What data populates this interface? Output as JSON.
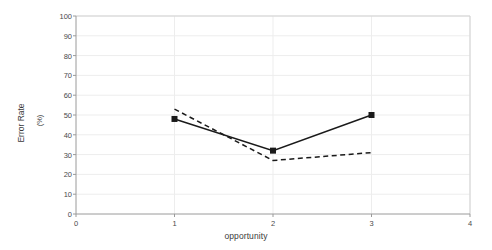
{
  "chart_data": {
    "type": "line",
    "title": "",
    "xlabel": "opportunity",
    "ylabel": "Error Rate",
    "yunit": "(%)",
    "x": [
      1,
      2,
      3
    ],
    "xlim": [
      0,
      4
    ],
    "ylim": [
      0,
      100
    ],
    "xticks": [
      "0",
      "1",
      "2",
      "3",
      "4"
    ],
    "yticks": [
      "0",
      "10",
      "20",
      "30",
      "40",
      "50",
      "60",
      "70",
      "80",
      "90",
      "100"
    ],
    "grid": true,
    "legend": "none",
    "series": [
      {
        "name": "series-solid",
        "style": "solid",
        "marker": "square",
        "color": "#1a1a1a",
        "values": [
          48,
          32,
          50
        ]
      },
      {
        "name": "series-dashed",
        "style": "dashed",
        "marker": "none",
        "color": "#1a1a1a",
        "values": [
          53,
          27,
          31
        ]
      }
    ]
  },
  "colors": {
    "background": "#ffffff",
    "axis": "#9a9a9a",
    "grid": "#ededed",
    "data": "#1a1a1a",
    "text": "#4a4a4a"
  }
}
